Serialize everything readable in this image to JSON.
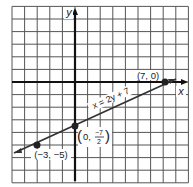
{
  "graph": {
    "axis_labels": {
      "x": "x",
      "y": "y"
    },
    "equation": "x = 2y + 7",
    "grid": {
      "cols_left_of_y_axis": 5,
      "cols_right_of_y_axis": 9,
      "rows_above_x_axis": 6,
      "rows_below_x_axis": 8
    },
    "points": [
      {
        "label": "(7, 0)",
        "x": 7,
        "y": 0
      },
      {
        "label_prefix": "(0, ",
        "fraction_num": "−7",
        "fraction_den": "2",
        "label_suffix": ")",
        "x": 0,
        "y": -3.5
      },
      {
        "label": "(−3, −5)",
        "x": -3,
        "y": -5
      }
    ],
    "colors": {
      "grid": "#555555",
      "axis": "#111111",
      "line": "#333333"
    }
  }
}
